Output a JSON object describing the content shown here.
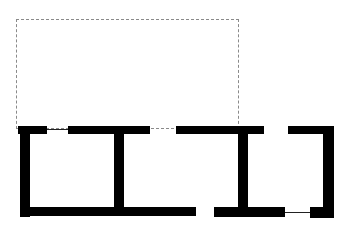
{
  "diagram": {
    "type": "floor-plan",
    "colors": {
      "wall": "#000000",
      "window": "#222222",
      "dashed_outline": "#8a8a8a",
      "background": "#ffffff"
    },
    "dashed_outline": {
      "x": 16,
      "y": 19,
      "w": 223,
      "h": 110
    },
    "walls": [
      {
        "name": "top-left-short-wall",
        "x": 18,
        "y": 126,
        "w": 29,
        "h": 8
      },
      {
        "name": "left-outer-wall",
        "x": 20,
        "y": 126,
        "w": 10,
        "h": 91
      },
      {
        "name": "top-wall-segment-2",
        "x": 68,
        "y": 126,
        "w": 82,
        "h": 8
      },
      {
        "name": "interior-wall-1",
        "x": 114,
        "y": 126,
        "w": 10,
        "h": 90
      },
      {
        "name": "bottom-wall-left",
        "x": 20,
        "y": 207,
        "w": 176,
        "h": 9
      },
      {
        "name": "top-wall-segment-3",
        "x": 176,
        "y": 126,
        "w": 88,
        "h": 8
      },
      {
        "name": "interior-wall-2",
        "x": 238,
        "y": 126,
        "w": 10,
        "h": 90
      },
      {
        "name": "bottom-wall-middle",
        "x": 214,
        "y": 207,
        "w": 71,
        "h": 10
      },
      {
        "name": "top-wall-right",
        "x": 288,
        "y": 126,
        "w": 46,
        "h": 8
      },
      {
        "name": "right-outer-wall",
        "x": 323,
        "y": 126,
        "w": 11,
        "h": 92
      },
      {
        "name": "bottom-wall-right",
        "x": 310,
        "y": 207,
        "w": 24,
        "h": 11
      }
    ],
    "windows": [
      {
        "name": "window-top-left",
        "x": 47,
        "y": 129,
        "w": 21
      },
      {
        "name": "window-bottom-right",
        "x": 285,
        "y": 212,
        "w": 25
      }
    ]
  }
}
